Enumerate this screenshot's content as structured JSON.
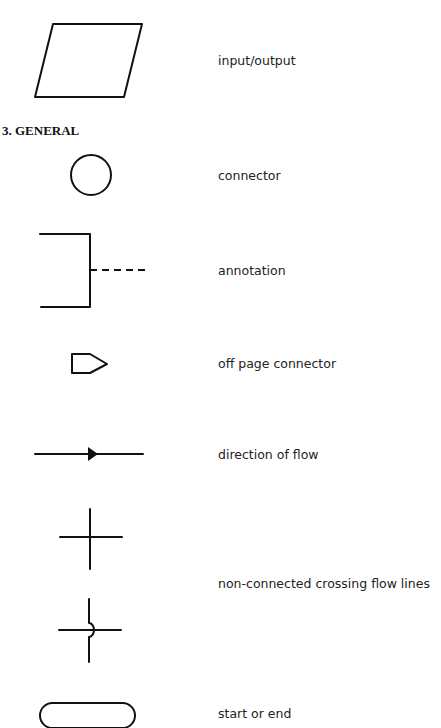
{
  "section": {
    "heading": "3. GENERAL"
  },
  "symbols": [
    {
      "shape": "parallelogram",
      "label": "input/output"
    },
    {
      "shape": "circle",
      "label": "connector"
    },
    {
      "shape": "bracket-dashed",
      "label": "annotation"
    },
    {
      "shape": "pentagon-tag",
      "label": "off page connector"
    },
    {
      "shape": "arrow-line",
      "label": "direction of flow"
    },
    {
      "shape": "crossing-lines",
      "label": "non-connected crossing flow lines"
    },
    {
      "shape": "rounded-rectangle",
      "label": "start or end"
    }
  ],
  "colors": {
    "stroke": "#111111",
    "background": "#ffffff"
  }
}
